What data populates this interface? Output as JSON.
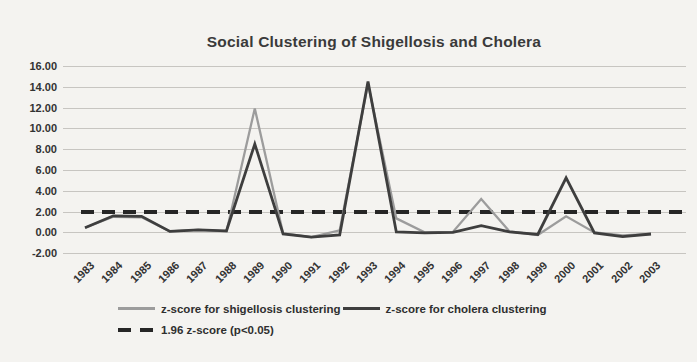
{
  "chart_data": {
    "type": "line",
    "title": "Social Clustering of Shigellosis and Cholera",
    "x": [
      1983,
      1984,
      1985,
      1986,
      1987,
      1988,
      1989,
      1990,
      1991,
      1992,
      1993,
      1994,
      1995,
      1996,
      1997,
      1998,
      1999,
      2000,
      2001,
      2002,
      2003
    ],
    "series": [
      {
        "name": "z-score for shigellosis clustering",
        "color": "#9c9c9c",
        "values": [
          0.45,
          1.5,
          1.45,
          0.1,
          0.25,
          0.1,
          11.9,
          -0.1,
          -0.45,
          0.2,
          14.3,
          1.35,
          0.0,
          0.05,
          3.2,
          0.1,
          -0.25,
          1.55,
          0.0,
          -0.3,
          -0.15
        ]
      },
      {
        "name": "z-score for cholera clustering",
        "color": "#3e3e3e",
        "values": [
          0.45,
          1.6,
          1.55,
          0.1,
          0.25,
          0.15,
          8.5,
          -0.15,
          -0.45,
          -0.25,
          14.5,
          0.05,
          -0.05,
          0.0,
          0.65,
          0.05,
          -0.2,
          5.25,
          -0.05,
          -0.4,
          -0.15
        ]
      }
    ],
    "threshold": {
      "label": "1.96 z-score (p<0.05)",
      "value": 1.96,
      "color": "#262626"
    },
    "ylim": [
      -2,
      16
    ],
    "ytick_step": 2,
    "yticks": [
      "16.00",
      "14.00",
      "12.00",
      "10.00",
      "8.00",
      "6.00",
      "4.00",
      "2.00",
      "0.00",
      "-2.00"
    ],
    "grid": true,
    "legend_position": "bottom"
  },
  "colors": {
    "background": "#f4f3f0",
    "gridline": "#c7c5c1",
    "label_text": "#323232"
  }
}
